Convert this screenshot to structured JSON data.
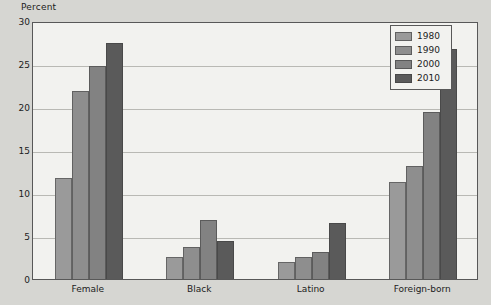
{
  "chart_data": {
    "type": "bar",
    "title": "",
    "subtitle": "",
    "xlabel": "",
    "ylabel": "Percent",
    "ylim": [
      0,
      30
    ],
    "ytick_step": 5,
    "yticks": [
      30,
      25,
      20,
      15,
      10,
      5,
      0
    ],
    "grid": true,
    "legend_position": "top-right",
    "categories": [
      "Female",
      "Black",
      "Latino",
      "Foreign-born"
    ],
    "series": [
      {
        "name": "1980",
        "color": "#9a9a9a",
        "values": [
          11.8,
          2.6,
          2.0,
          11.3
        ]
      },
      {
        "name": "1990",
        "color": "#8e8e8e",
        "values": [
          21.9,
          3.7,
          2.6,
          13.1
        ]
      },
      {
        "name": "2000",
        "color": "#828282",
        "values": [
          24.8,
          6.9,
          3.1,
          19.4
        ]
      },
      {
        "name": "2010",
        "color": "#5a5a5a",
        "values": [
          27.4,
          4.4,
          6.5,
          26.8
        ]
      }
    ]
  },
  "colors": {
    "page_background": "#d6d6d2",
    "plot_background": "#f2f2ef",
    "axis": "#585858",
    "gridline": "#b9b9b4",
    "text": "#1c1c1c"
  }
}
